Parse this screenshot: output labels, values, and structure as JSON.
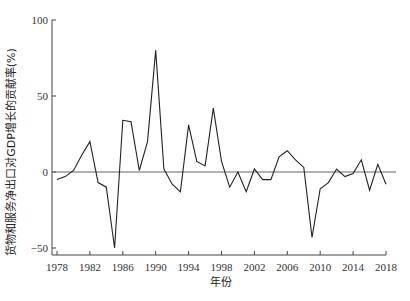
{
  "chart_data": {
    "type": "line",
    "title": "",
    "xlabel": "年份",
    "ylabel": "货物和服务净出口对GDP增长的贡献率(%)",
    "xlim": [
      1978,
      2018
    ],
    "ylim": [
      -50,
      100
    ],
    "x_ticks": [
      1978,
      1982,
      1986,
      1990,
      1994,
      1998,
      2002,
      2006,
      2010,
      2014,
      2018
    ],
    "y_ticks": [
      -50,
      0,
      50,
      100
    ],
    "y_tick_labels": [
      "−50",
      "0",
      "50",
      "100"
    ],
    "grid": false,
    "reference_line": {
      "y": 0
    },
    "legend": null,
    "x": [
      1978,
      1979,
      1980,
      1981,
      1982,
      1983,
      1984,
      1985,
      1986,
      1987,
      1988,
      1989,
      1990,
      1991,
      1992,
      1993,
      1994,
      1995,
      1996,
      1997,
      1998,
      1999,
      2000,
      2001,
      2002,
      2003,
      2004,
      2005,
      2006,
      2007,
      2008,
      2009,
      2010,
      2011,
      2012,
      2013,
      2014,
      2015,
      2016,
      2017,
      2018
    ],
    "series": [
      {
        "name": "货物和服务净出口对GDP增长的贡献率",
        "values": [
          -5,
          -3,
          1,
          11,
          20,
          -7,
          -10,
          -50,
          34,
          33,
          1,
          20,
          80,
          2,
          -8,
          -13,
          31,
          7,
          4,
          42,
          7,
          -10,
          0,
          -13,
          2,
          -5,
          -5,
          10,
          14,
          8,
          3,
          -43,
          -11,
          -7,
          2,
          -3,
          -1,
          8,
          -12,
          5,
          -8
        ]
      }
    ],
    "colors": {
      "line": "#222222",
      "axis": "#444444",
      "zero_line": "#666666"
    }
  }
}
